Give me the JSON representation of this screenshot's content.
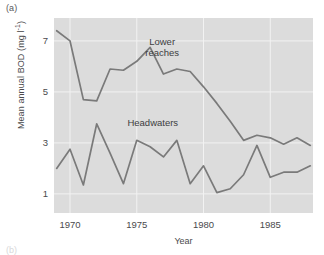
{
  "figure": {
    "panel_label": "(a)",
    "next_panel_label": "(b)",
    "background_color": "#ffffff",
    "plot_background_color": "#dcdcdc",
    "gridline_color": "#f2f2f2",
    "line_color": "#7a7a7a",
    "text_color": "#4a4a4c"
  },
  "chart_data": {
    "type": "line",
    "title": "",
    "xlabel": "Year",
    "ylabel": "Mean annual BOD (mg l⁻¹)",
    "ylabel_parts": {
      "main": "Mean annual BOD (mg l",
      "superscript": "-1",
      "tail": ")"
    },
    "xlim": [
      1968.8,
      1988.2
    ],
    "ylim": [
      0.25,
      7.9
    ],
    "xticks": [
      1970,
      1975,
      1980,
      1985
    ],
    "xtick_labels": [
      "1970",
      "1975",
      "1980",
      "1985"
    ],
    "yticks": [
      1,
      3,
      5,
      7
    ],
    "ytick_labels": [
      "1",
      "3",
      "5",
      "7"
    ],
    "grid": true,
    "grid_orientation": "both",
    "legend": "none",
    "annotations": [
      {
        "text": "Lower\nreaches",
        "x": 1976.9,
        "y": 6.9,
        "name": "lower-reaches-label"
      },
      {
        "text": "Headwaters",
        "x": 1976.2,
        "y": 3.75,
        "name": "headwaters-label"
      }
    ],
    "x": [
      1969,
      1970,
      1971,
      1972,
      1973,
      1974,
      1975,
      1976,
      1977,
      1978,
      1979,
      1980,
      1981,
      1982,
      1983,
      1984,
      1985,
      1986,
      1987,
      1988
    ],
    "series": [
      {
        "name": "Lower reaches",
        "values": [
          7.4,
          7.0,
          4.7,
          4.65,
          5.9,
          5.85,
          6.2,
          6.75,
          5.7,
          5.9,
          5.8,
          5.2,
          4.55,
          3.85,
          3.1,
          3.3,
          3.2,
          2.95,
          3.2,
          2.9
        ]
      },
      {
        "name": "Headwaters",
        "values": [
          2.0,
          2.75,
          1.35,
          3.75,
          2.6,
          1.4,
          3.1,
          2.85,
          2.45,
          3.1,
          1.4,
          2.1,
          1.05,
          1.2,
          1.75,
          2.9,
          1.65,
          1.85,
          1.85,
          2.1
        ]
      }
    ]
  }
}
